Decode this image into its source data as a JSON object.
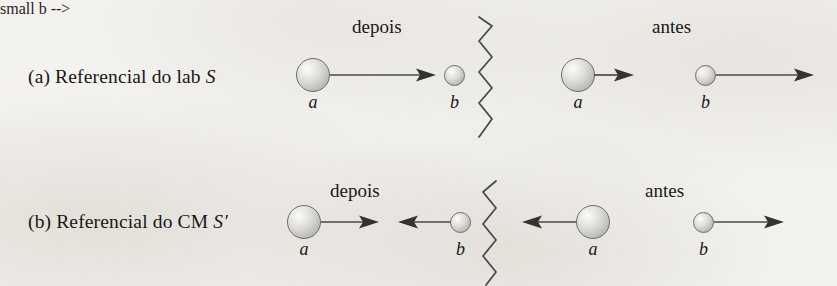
{
  "figure": {
    "type": "physics-collision-diagram",
    "language": "pt-BR",
    "background_color": "#f3f1ee",
    "ink_color": "#1d1d1d"
  },
  "rows": [
    {
      "id": "lab-frame",
      "tag": "(a)",
      "label_text": "(a) Referencial do lab",
      "frame_symbol": "S",
      "panels": [
        {
          "id": "lab-depois",
          "phase_label": "depois",
          "particles": [
            {
              "name": "a",
              "size": "large",
              "arrow_direction": "right",
              "arrow_length": "long"
            },
            {
              "name": "b",
              "size": "small",
              "arrow_direction": "none",
              "arrow_length": "none"
            }
          ]
        },
        {
          "id": "lab-antes",
          "phase_label": "antes",
          "particles": [
            {
              "name": "a",
              "size": "large",
              "arrow_direction": "right",
              "arrow_length": "short"
            },
            {
              "name": "b",
              "size": "small",
              "arrow_direction": "right",
              "arrow_length": "long"
            }
          ]
        }
      ]
    },
    {
      "id": "cm-frame",
      "tag": "(b)",
      "label_text": "(b) Referencial do CM",
      "frame_symbol": "S′",
      "panels": [
        {
          "id": "cm-depois",
          "phase_label": "depois",
          "particles": [
            {
              "name": "a",
              "size": "large",
              "arrow_direction": "right",
              "arrow_length": "medium"
            },
            {
              "name": "b",
              "size": "small",
              "arrow_direction": "left",
              "arrow_length": "medium"
            }
          ]
        },
        {
          "id": "cm-antes",
          "phase_label": "antes",
          "particles": [
            {
              "name": "a",
              "size": "large",
              "arrow_direction": "left",
              "arrow_length": "medium"
            },
            {
              "name": "b",
              "size": "small",
              "arrow_direction": "right",
              "arrow_length": "medium"
            }
          ]
        }
      ]
    }
  ],
  "separators": [
    {
      "id": "separator-top",
      "style": "zigzag",
      "orientation": "vertical"
    },
    {
      "id": "separator-bottom",
      "style": "zigzag",
      "orientation": "vertical"
    }
  ]
}
